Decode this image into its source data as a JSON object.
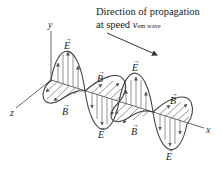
{
  "caption": {
    "line1": "Direction of propagation",
    "line2_prefix": "at speed ",
    "line2_var": "v",
    "line2_sub": "em wave"
  },
  "axes": {
    "x": "x",
    "y": "y",
    "z": "z"
  },
  "field_labels": {
    "E": "E",
    "B": "B",
    "vector_arrow": "→"
  },
  "colors": {
    "stroke": "#444444",
    "hatch": "#666666",
    "text": "#222222",
    "background": "#ffffff"
  }
}
